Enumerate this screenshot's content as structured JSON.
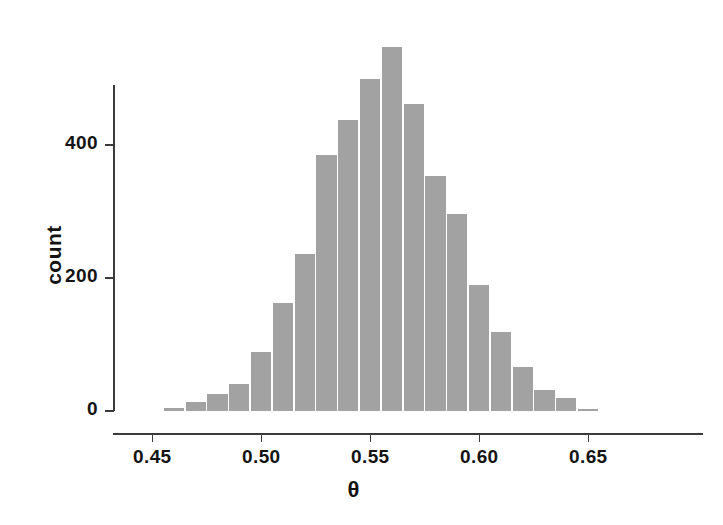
{
  "figure": {
    "background_color": "#ffffff",
    "bar_color": "#a2a2a2",
    "axis_color": "#3b3b3b",
    "text_color": "#121212"
  },
  "axes": {
    "y_title": "count",
    "x_title": "θ",
    "y_ticks": [
      "0",
      "200",
      "400"
    ],
    "x_ticks": [
      "0.45",
      "0.50",
      "0.55",
      "0.60",
      "0.65"
    ]
  },
  "chart_data": {
    "type": "bar",
    "title": "",
    "xlabel": "θ",
    "ylabel": "count",
    "xlim": [
      0.435,
      0.675
    ],
    "ylim": [
      0,
      560
    ],
    "grid": false,
    "legend": "none",
    "bin_width": 0.01,
    "bin_edges": [
      0.455,
      0.465,
      0.475,
      0.485,
      0.495,
      0.505,
      0.515,
      0.525,
      0.535,
      0.545,
      0.555,
      0.565,
      0.575,
      0.585,
      0.595,
      0.605,
      0.615,
      0.625,
      0.635,
      0.645,
      0.655
    ],
    "categories": [
      "0.455-0.465",
      "0.465-0.475",
      "0.475-0.485",
      "0.485-0.495",
      "0.495-0.505",
      "0.505-0.515",
      "0.515-0.525",
      "0.525-0.535",
      "0.535-0.545",
      "0.545-0.555",
      "0.555-0.565",
      "0.565-0.575",
      "0.575-0.585",
      "0.585-0.595",
      "0.595-0.605",
      "0.605-0.615",
      "0.615-0.625",
      "0.625-0.635",
      "0.635-0.645",
      "0.645-0.655"
    ],
    "values": [
      5,
      14,
      26,
      40,
      88,
      163,
      236,
      385,
      437,
      500,
      547,
      462,
      353,
      296,
      190,
      119,
      66,
      31,
      19,
      3
    ],
    "y_tick_values": [
      0,
      200,
      400
    ],
    "x_tick_values": [
      0.45,
      0.5,
      0.55,
      0.6,
      0.65
    ]
  }
}
